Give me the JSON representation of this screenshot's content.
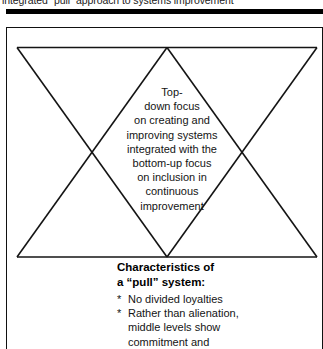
{
  "caption": {
    "text": "integrated “pull” approach to systems improvement"
  },
  "rule": {
    "color": "#000000"
  },
  "figure": {
    "border_color": "#111111",
    "background": "#ffffff"
  },
  "diagram": {
    "type": "hourglass-triangles",
    "stroke_color": "#141414",
    "center_text_lines": [
      "Top-",
      "down focus",
      "on creating and",
      "improving systems",
      "integrated with the",
      "bottom-up focus",
      "on inclusion in",
      "continuous",
      "improvement"
    ]
  },
  "characteristics": {
    "heading_lines": [
      "Characteristics of",
      "a “pull” system:"
    ],
    "bullet_marker": "*",
    "items": [
      {
        "lines": [
          "No divided loyalties"
        ]
      },
      {
        "lines": [
          "Rather than alienation,",
          "middle levels show",
          "commitment and",
          "enthusiasm"
        ]
      }
    ]
  }
}
